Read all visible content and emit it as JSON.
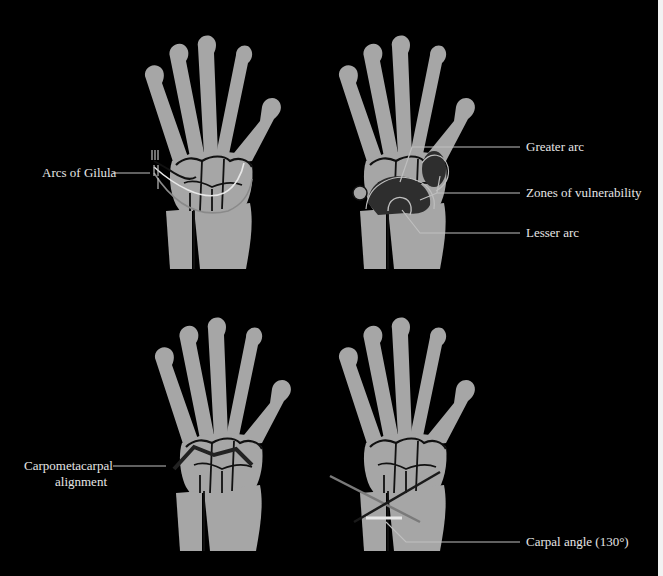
{
  "figure": {
    "background": "#000000",
    "bone_color": "#a6a6a6",
    "outline_color": "#111111",
    "leader_color": "#bfbfbf",
    "highlight_color": "#e8e8e8",
    "zone_color": "#2e2e2e"
  },
  "panels": [
    {
      "id": "top-left",
      "title": "Arcs of Gilula view",
      "labels": [
        {
          "text": "Arcs of Gilula"
        }
      ]
    },
    {
      "id": "top-right",
      "title": "Greater and lesser arcs view",
      "labels": [
        {
          "text": "Greater arc"
        },
        {
          "text": "Zones of vulnerability"
        },
        {
          "text": "Lesser arc"
        }
      ]
    },
    {
      "id": "bottom-left",
      "title": "Carpometacarpal alignment view",
      "labels": [
        {
          "text": "Carpometacarpal"
        },
        {
          "text": "alignment"
        }
      ]
    },
    {
      "id": "bottom-right",
      "title": "Carpal angle view",
      "labels": [
        {
          "text": "Carpal angle (130°)"
        }
      ]
    }
  ]
}
